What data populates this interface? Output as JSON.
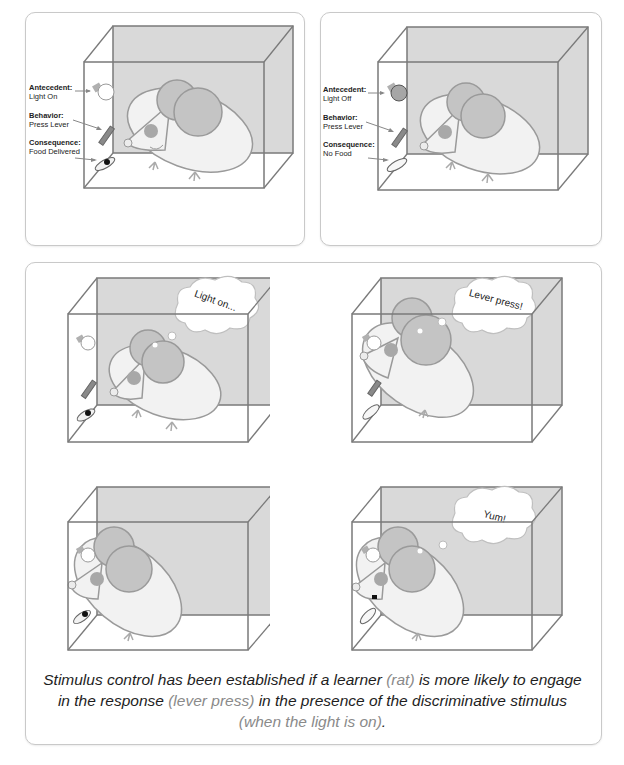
{
  "panels": {
    "top_left": {
      "antecedent": {
        "label": "Antecedent:",
        "value": "Light On"
      },
      "behavior": {
        "label": "Behavior:",
        "value": "Press Lever"
      },
      "consequence": {
        "label": "Consequence:",
        "value": "Food Delivered"
      }
    },
    "top_right": {
      "antecedent": {
        "label": "Antecedent:",
        "value": "Light Off"
      },
      "behavior": {
        "label": "Behavior:",
        "value": "Press Lever"
      },
      "consequence": {
        "label": "Consequence:",
        "value": "No Food"
      }
    },
    "bottom": {
      "scenes": [
        {
          "thought": "Light on..."
        },
        {
          "thought": "Lever press!"
        },
        {
          "thought": ""
        },
        {
          "thought": "Yum!"
        }
      ],
      "caption": {
        "part1": "Stimulus control has been established if a learner ",
        "hl1": "(rat)",
        "part2": " is more likely to engage in the response ",
        "hl2": "(lever press)",
        "part3": " in the presence of the discriminative stimulus ",
        "hl3": "(when the light is on)",
        "part4": "."
      }
    }
  },
  "colors": {
    "box_back": "#d9d9d9",
    "box_edge": "#7a7a7a",
    "rat_body": "#f2f2f2",
    "rat_ear": "#c4c4c4",
    "rat_eye": "#a8a8a8",
    "highlight_text": "#8a8a8a"
  }
}
